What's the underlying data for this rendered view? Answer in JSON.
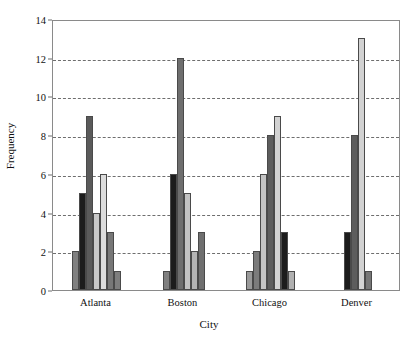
{
  "chart_data": {
    "type": "bar",
    "title": "",
    "xlabel": "City",
    "ylabel": "Frequency",
    "categories": [
      "Atlanta",
      "Boston",
      "Chicago",
      "Denver"
    ],
    "ylim": [
      0,
      14
    ],
    "yticks": [
      0,
      2,
      4,
      6,
      8,
      10,
      12,
      14
    ],
    "ytick_labels": [
      "0",
      "2",
      "4",
      "6",
      "8",
      "10",
      "12",
      "14"
    ],
    "grid": "horizontal-dashed",
    "legend": "none",
    "groups": [
      {
        "category": "Atlanta",
        "bars": [
          {
            "value": 2,
            "color": "#808080"
          },
          {
            "value": 5,
            "color": "#1c1c1c"
          },
          {
            "value": 9,
            "color": "#5a5a5a"
          },
          {
            "value": 4,
            "color": "#c9c9c9"
          },
          {
            "value": 6,
            "color": "#dcdcdc"
          },
          {
            "value": 3,
            "color": "#777777"
          },
          {
            "value": 1,
            "color": "#7e7e7e"
          }
        ]
      },
      {
        "category": "Boston",
        "bars": [
          {
            "value": 1,
            "color": "#808080"
          },
          {
            "value": 6,
            "color": "#1c1c1c"
          },
          {
            "value": 12,
            "color": "#6e6e6e"
          },
          {
            "value": 5,
            "color": "#c2c2c2"
          },
          {
            "value": 2,
            "color": "#b4b4b4"
          },
          {
            "value": 3,
            "color": "#6f6f6f"
          }
        ]
      },
      {
        "category": "Chicago",
        "bars": [
          {
            "value": 1,
            "color": "#9a9a9a"
          },
          {
            "value": 2,
            "color": "#7c7c7c"
          },
          {
            "value": 6,
            "color": "#c4c4c4"
          },
          {
            "value": 8,
            "color": "#5d5d5d"
          },
          {
            "value": 9,
            "color": "#d2d2d2"
          },
          {
            "value": 3,
            "color": "#1c1c1c"
          },
          {
            "value": 1,
            "color": "#b0b0b0"
          }
        ]
      },
      {
        "category": "Denver",
        "bars": [
          {
            "value": 3,
            "color": "#1c1c1c"
          },
          {
            "value": 8,
            "color": "#5d5d5d"
          },
          {
            "value": 13,
            "color": "#d2d2d2"
          },
          {
            "value": 1,
            "color": "#767676"
          }
        ]
      }
    ]
  }
}
